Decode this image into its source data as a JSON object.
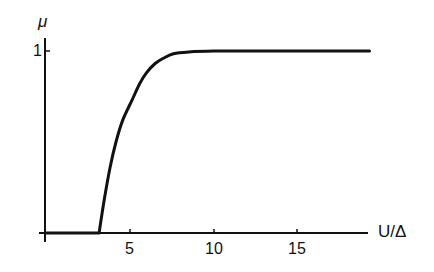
{
  "chart_data": {
    "type": "line",
    "title": "",
    "xlabel": "U/Δ",
    "ylabel": "μ",
    "xlim": [
      0,
      19.5
    ],
    "ylim": [
      0,
      1
    ],
    "xticks": [
      5,
      10,
      15
    ],
    "yticks": [
      1
    ],
    "xtick_labels": [
      "5",
      "10",
      "15"
    ],
    "ytick_labels": [
      "1"
    ],
    "grid": false,
    "legend": null,
    "series": [
      {
        "name": "μ",
        "x": [
          0,
          3.2,
          3.5,
          3.85,
          4.2,
          4.6,
          5.15,
          5.6,
          6.0,
          6.5,
          7.0,
          7.6,
          8.5,
          10,
          12,
          15,
          19.2
        ],
        "y": [
          0,
          0,
          0.18,
          0.36,
          0.5,
          0.62,
          0.73,
          0.82,
          0.88,
          0.93,
          0.96,
          0.985,
          0.995,
          1.0,
          1.0,
          1.0,
          1.0
        ]
      }
    ]
  },
  "labels": {
    "y_axis": "μ",
    "x_axis": "U/Δ",
    "y_tick_1": "1",
    "x_tick_5": "5",
    "x_tick_10": "10",
    "x_tick_15": "15"
  }
}
